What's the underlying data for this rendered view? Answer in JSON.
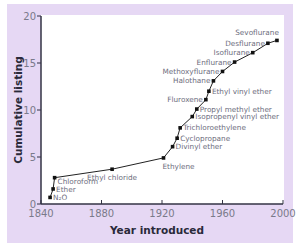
{
  "chart_data": {
    "type": "line",
    "title": "",
    "xlabel": "Year introduced",
    "ylabel": "Cumulative listing",
    "xlim": [
      1840,
      2000
    ],
    "ylim": [
      0,
      20
    ],
    "xticks": [
      1840,
      1880,
      1920,
      1960,
      2000
    ],
    "yticks": [
      0,
      5,
      10,
      15,
      20
    ],
    "grid": false,
    "legend": null,
    "colors": {
      "panel": "#e6d8f4",
      "plot": "#ffffff",
      "line": "#222222",
      "axis": "#333344",
      "text": "#6e6e7e"
    },
    "points": [
      {
        "label": "N₂O",
        "x": 1846,
        "y": 0.7,
        "label_pos": "right"
      },
      {
        "label": "Ether",
        "x": 1848,
        "y": 1.6,
        "label_pos": "right"
      },
      {
        "label": "Chloroform",
        "x": 1849,
        "y": 2.8,
        "label_pos": "below-right"
      },
      {
        "label": "Ethyl chloride",
        "x": 1887,
        "y": 3.7,
        "label_pos": "below"
      },
      {
        "label": "Ethylene",
        "x": 1921,
        "y": 4.9,
        "label_pos": "below"
      },
      {
        "label": "Divinyl ether",
        "x": 1927,
        "y": 6.1,
        "label_pos": "right"
      },
      {
        "label": "Cyclopropane",
        "x": 1930,
        "y": 7.0,
        "label_pos": "right"
      },
      {
        "label": "Trichloroethylene",
        "x": 1932,
        "y": 8.1,
        "label_pos": "right"
      },
      {
        "label": "Isopropenyl vinyl ether",
        "x": 1940,
        "y": 9.3,
        "label_pos": "right"
      },
      {
        "label": "Propyl methyl ether",
        "x": 1943,
        "y": 10.1,
        "label_pos": "right"
      },
      {
        "label": "Fluroxene",
        "x": 1949,
        "y": 11.1,
        "label_pos": "left"
      },
      {
        "label": "Ethyl vinyl ether",
        "x": 1951,
        "y": 12.0,
        "label_pos": "right"
      },
      {
        "label": "Halothane",
        "x": 1954,
        "y": 13.1,
        "label_pos": "left"
      },
      {
        "label": "Methoxyflurane",
        "x": 1960,
        "y": 14.1,
        "label_pos": "left"
      },
      {
        "label": "Enflurane",
        "x": 1968,
        "y": 15.1,
        "label_pos": "left"
      },
      {
        "label": "Isoflurane",
        "x": 1980,
        "y": 16.1,
        "label_pos": "left"
      },
      {
        "label": "Desflurane",
        "x": 1990,
        "y": 17.1,
        "label_pos": "left"
      },
      {
        "label": "Sevoflurane",
        "x": 1996,
        "y": 17.4,
        "label_pos": "above-left"
      }
    ]
  }
}
